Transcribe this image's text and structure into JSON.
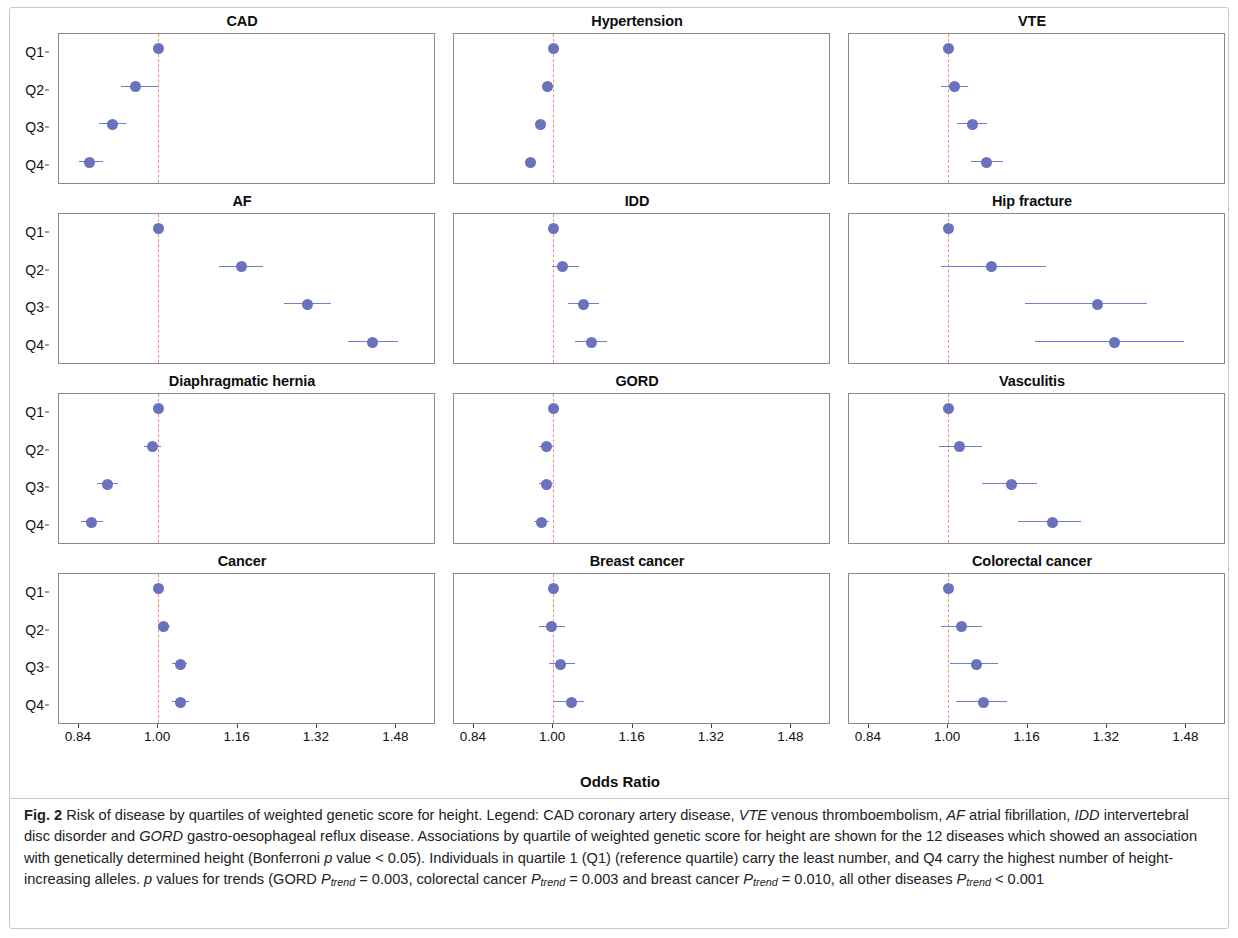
{
  "figure": {
    "axis_title": "Odds Ratio",
    "quartile_labels": [
      "Q1",
      "Q2",
      "Q3",
      "Q4"
    ],
    "x_ticks": [
      "0.84",
      "1.00",
      "1.16",
      "1.32",
      "1.48"
    ],
    "caption_label": "Fig. 2",
    "caption_text": "Risk of disease by quartiles of weighted genetic score for height. Legend: CAD coronary artery disease, VTE venous thromboembolism, AF atrial fibrillation, IDD intervertebral disc disorder and GORD gastro-oesophageal reflux disease. Associations by quartile of weighted genetic score for height are shown for the 12 diseases which showed an association with genetically determined height (Bonferroni p value < 0.05). Individuals in quartile 1 (Q1) (reference quartile) carry the least number, and Q4 carry the highest number of height-increasing alleles. p values for trends (GORD Ptrend = 0.003, colorectal cancer Ptrend = 0.003 and breast cancer Ptrend = 0.010, all other diseases Ptrend < 0.001",
    "colors": {
      "point": "#6a72be",
      "interval": "#6f7fd0",
      "reference_line": "#ef8f84",
      "panel_border": "#8a8a8a"
    }
  },
  "chart_data": {
    "type": "scatter",
    "title": "Risk of disease by quartiles of weighted genetic score for height",
    "xlabel": "Odds Ratio",
    "ylabel": "",
    "xlim": [
      0.8,
      1.56
    ],
    "xticks": [
      0.84,
      1.0,
      1.16,
      1.32,
      1.48
    ],
    "categories": [
      "Q1",
      "Q2",
      "Q3",
      "Q4"
    ],
    "reference_value": 1.0,
    "grid": false,
    "legend": "none",
    "panel_layout": {
      "rows": 4,
      "cols": 3
    },
    "panels": [
      {
        "title": "CAD",
        "row": 0,
        "col": 0,
        "points": [
          {
            "quartile": "Q1",
            "or": 1.0,
            "ci_low": 1.0,
            "ci_high": 1.0
          },
          {
            "quartile": "Q2",
            "or": 0.955,
            "ci_low": 0.925,
            "ci_high": 1.0
          },
          {
            "quartile": "Q3",
            "or": 0.908,
            "ci_low": 0.88,
            "ci_high": 0.935
          },
          {
            "quartile": "Q4",
            "or": 0.862,
            "ci_low": 0.84,
            "ci_high": 0.888
          }
        ]
      },
      {
        "title": "Hypertension",
        "row": 0,
        "col": 1,
        "points": [
          {
            "quartile": "Q1",
            "or": 1.0,
            "ci_low": 1.0,
            "ci_high": 1.0
          },
          {
            "quartile": "Q2",
            "or": 0.989,
            "ci_low": 0.982,
            "ci_high": 1.0
          },
          {
            "quartile": "Q3",
            "or": 0.975,
            "ci_low": 0.966,
            "ci_high": 0.985
          },
          {
            "quartile": "Q4",
            "or": 0.955,
            "ci_low": 0.944,
            "ci_high": 0.966
          }
        ]
      },
      {
        "title": "VTE",
        "row": 0,
        "col": 2,
        "points": [
          {
            "quartile": "Q1",
            "or": 1.0,
            "ci_low": 1.0,
            "ci_high": 1.0
          },
          {
            "quartile": "Q2",
            "or": 1.012,
            "ci_low": 0.985,
            "ci_high": 1.04
          },
          {
            "quartile": "Q3",
            "or": 1.049,
            "ci_low": 1.018,
            "ci_high": 1.078
          },
          {
            "quartile": "Q4",
            "or": 1.077,
            "ci_low": 1.045,
            "ci_high": 1.11
          }
        ]
      },
      {
        "title": "AF",
        "row": 1,
        "col": 0,
        "points": [
          {
            "quartile": "Q1",
            "or": 1.0,
            "ci_low": 1.0,
            "ci_high": 1.0
          },
          {
            "quartile": "Q2",
            "or": 1.168,
            "ci_low": 1.123,
            "ci_high": 1.212
          },
          {
            "quartile": "Q3",
            "or": 1.3,
            "ci_low": 1.253,
            "ci_high": 1.348
          },
          {
            "quartile": "Q4",
            "or": 1.432,
            "ci_low": 1.383,
            "ci_high": 1.483
          }
        ]
      },
      {
        "title": "IDD",
        "row": 1,
        "col": 1,
        "points": [
          {
            "quartile": "Q1",
            "or": 1.0,
            "ci_low": 1.0,
            "ci_high": 1.0
          },
          {
            "quartile": "Q2",
            "or": 1.018,
            "ci_low": 0.998,
            "ci_high": 1.053
          },
          {
            "quartile": "Q3",
            "or": 1.062,
            "ci_low": 1.03,
            "ci_high": 1.092
          },
          {
            "quartile": "Q4",
            "or": 1.078,
            "ci_low": 1.043,
            "ci_high": 1.108
          }
        ]
      },
      {
        "title": "Hip fracture",
        "row": 1,
        "col": 2,
        "points": [
          {
            "quartile": "Q1",
            "or": 1.0,
            "ci_low": 1.0,
            "ci_high": 1.0
          },
          {
            "quartile": "Q2",
            "or": 1.088,
            "ci_low": 0.985,
            "ci_high": 1.198
          },
          {
            "quartile": "Q3",
            "or": 1.3,
            "ci_low": 1.155,
            "ci_high": 1.4
          },
          {
            "quartile": "Q4",
            "or": 1.335,
            "ci_low": 1.175,
            "ci_high": 1.475
          }
        ]
      },
      {
        "title": "Diaphragmatic hernia",
        "row": 2,
        "col": 0,
        "points": [
          {
            "quartile": "Q1",
            "or": 1.0,
            "ci_low": 1.0,
            "ci_high": 1.0
          },
          {
            "quartile": "Q2",
            "or": 0.988,
            "ci_low": 0.972,
            "ci_high": 1.006
          },
          {
            "quartile": "Q3",
            "or": 0.897,
            "ci_low": 0.876,
            "ci_high": 0.918
          },
          {
            "quartile": "Q4",
            "or": 0.866,
            "ci_low": 0.845,
            "ci_high": 0.888
          }
        ]
      },
      {
        "title": "GORD",
        "row": 2,
        "col": 1,
        "points": [
          {
            "quartile": "Q1",
            "or": 1.0,
            "ci_low": 1.0,
            "ci_high": 1.0
          },
          {
            "quartile": "Q2",
            "or": 0.986,
            "ci_low": 0.972,
            "ci_high": 1.0
          },
          {
            "quartile": "Q3",
            "or": 0.986,
            "ci_low": 0.972,
            "ci_high": 1.0
          },
          {
            "quartile": "Q4",
            "or": 0.976,
            "ci_low": 0.962,
            "ci_high": 0.992
          }
        ]
      },
      {
        "title": "Vasculitis",
        "row": 2,
        "col": 2,
        "points": [
          {
            "quartile": "Q1",
            "or": 1.0,
            "ci_low": 1.0,
            "ci_high": 1.0
          },
          {
            "quartile": "Q2",
            "or": 1.022,
            "ci_low": 0.982,
            "ci_high": 1.068
          },
          {
            "quartile": "Q3",
            "or": 1.128,
            "ci_low": 1.068,
            "ci_high": 1.18
          },
          {
            "quartile": "Q4",
            "or": 1.21,
            "ci_low": 1.14,
            "ci_high": 1.268
          }
        ]
      },
      {
        "title": "Cancer",
        "row": 3,
        "col": 0,
        "points": [
          {
            "quartile": "Q1",
            "or": 1.0,
            "ci_low": 1.0,
            "ci_high": 1.0
          },
          {
            "quartile": "Q2",
            "or": 1.01,
            "ci_low": 1.0,
            "ci_high": 1.023
          },
          {
            "quartile": "Q3",
            "or": 1.044,
            "ci_low": 1.028,
            "ci_high": 1.058
          },
          {
            "quartile": "Q4",
            "or": 1.044,
            "ci_low": 1.028,
            "ci_high": 1.062
          }
        ]
      },
      {
        "title": "Breast cancer",
        "row": 3,
        "col": 1,
        "points": [
          {
            "quartile": "Q1",
            "or": 1.0,
            "ci_low": 1.0,
            "ci_high": 1.0
          },
          {
            "quartile": "Q2",
            "or": 0.996,
            "ci_low": 0.972,
            "ci_high": 1.024
          },
          {
            "quartile": "Q3",
            "or": 1.014,
            "ci_low": 0.991,
            "ci_high": 1.044
          },
          {
            "quartile": "Q4",
            "or": 1.036,
            "ci_low": 1.001,
            "ci_high": 1.062
          }
        ]
      },
      {
        "title": "Colorectal cancer",
        "row": 3,
        "col": 2,
        "points": [
          {
            "quartile": "Q1",
            "or": 1.0,
            "ci_low": 1.0,
            "ci_high": 1.0
          },
          {
            "quartile": "Q2",
            "or": 1.027,
            "ci_low": 0.986,
            "ci_high": 1.068
          },
          {
            "quartile": "Q3",
            "or": 1.058,
            "ci_low": 1.004,
            "ci_high": 1.1
          },
          {
            "quartile": "Q4",
            "or": 1.072,
            "ci_low": 1.016,
            "ci_high": 1.118
          }
        ]
      }
    ]
  }
}
